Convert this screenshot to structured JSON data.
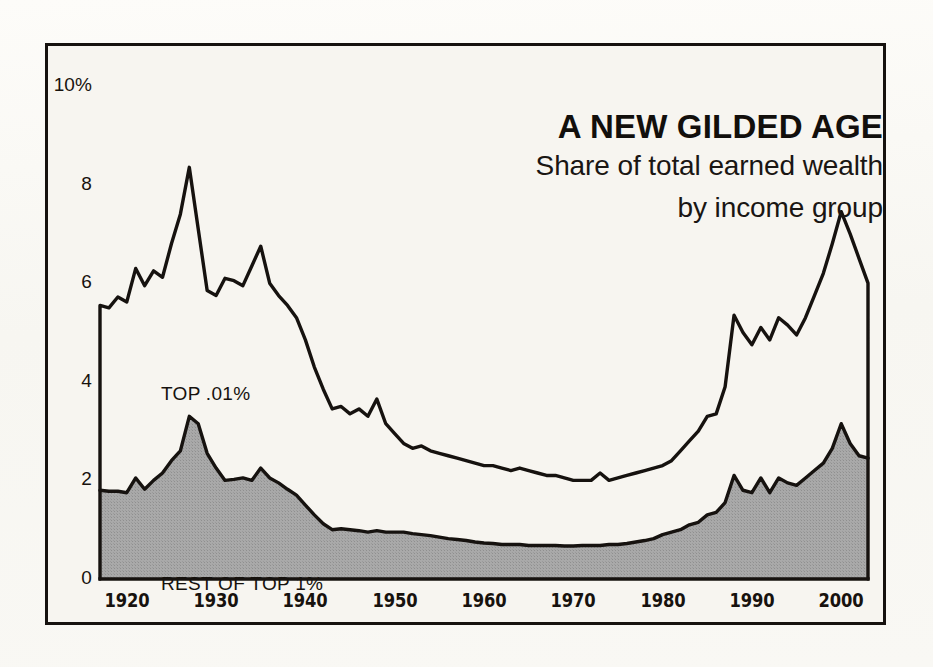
{
  "chart_data": {
    "type": "area",
    "title": "A NEW GILDED AGE",
    "subtitle_line1": "Share of total earned wealth",
    "subtitle_line2": "by income group",
    "xlabel": "",
    "ylabel": "",
    "ylim": [
      0,
      10
    ],
    "xlim": [
      1917,
      2003
    ],
    "grid": false,
    "legend_position": "inline-annotation",
    "y_ticks": [
      "10%",
      "8",
      "6",
      "4",
      "2",
      "0"
    ],
    "y_tick_values": [
      10,
      8,
      6,
      4,
      2,
      0
    ],
    "x_ticks": [
      "1920",
      "1930",
      "1940",
      "1950",
      "1960",
      "1970",
      "1980",
      "1990",
      "2000"
    ],
    "x_tick_values": [
      1920,
      1930,
      1940,
      1950,
      1960,
      1970,
      1980,
      1990,
      2000
    ],
    "annotations": [
      {
        "name": "top-01-label",
        "text": "TOP .01%",
        "x": 1920,
        "y": 4.85
      },
      {
        "name": "rest-of-top-1-label",
        "text": "REST OF TOP 1%",
        "x": 1920,
        "y": 1.0
      }
    ],
    "colors": {
      "line": "#16120f",
      "fill_lower": "#a5a5a5",
      "fill_upper": "#f7f5f0",
      "background": "#f7f5f0",
      "page": "#fbfaf7",
      "frame": "#16120f",
      "text": "#17120e"
    },
    "x": [
      1917,
      1918,
      1919,
      1920,
      1921,
      1922,
      1923,
      1924,
      1925,
      1926,
      1927,
      1928,
      1929,
      1930,
      1931,
      1932,
      1933,
      1934,
      1935,
      1936,
      1937,
      1938,
      1939,
      1940,
      1941,
      1942,
      1943,
      1944,
      1945,
      1946,
      1947,
      1948,
      1949,
      1950,
      1951,
      1952,
      1953,
      1954,
      1955,
      1956,
      1957,
      1958,
      1959,
      1960,
      1961,
      1962,
      1963,
      1964,
      1965,
      1966,
      1967,
      1968,
      1969,
      1970,
      1971,
      1972,
      1973,
      1974,
      1975,
      1976,
      1977,
      1978,
      1979,
      1980,
      1981,
      1982,
      1983,
      1984,
      1985,
      1986,
      1987,
      1988,
      1989,
      1990,
      1991,
      1992,
      1993,
      1994,
      1995,
      1996,
      1997,
      1998,
      1999,
      2000,
      2001,
      2002,
      2003
    ],
    "series": [
      {
        "name": "TOP .01%",
        "note": "Upper boundary: total share of top 1% (top .01% band is the white area between this line and the gray area)",
        "values": [
          5.55,
          5.5,
          5.72,
          5.62,
          6.3,
          5.95,
          6.25,
          6.12,
          6.8,
          7.4,
          8.35,
          7.1,
          5.85,
          5.75,
          6.1,
          6.05,
          5.95,
          6.35,
          6.75,
          6.0,
          5.75,
          5.55,
          5.3,
          4.85,
          4.3,
          3.85,
          3.45,
          3.5,
          3.35,
          3.45,
          3.3,
          3.65,
          3.15,
          2.95,
          2.75,
          2.65,
          2.7,
          2.6,
          2.55,
          2.5,
          2.45,
          2.4,
          2.35,
          2.3,
          2.3,
          2.25,
          2.2,
          2.25,
          2.2,
          2.15,
          2.1,
          2.1,
          2.05,
          2.0,
          2.0,
          2.0,
          2.15,
          2.0,
          2.05,
          2.1,
          2.15,
          2.2,
          2.25,
          2.3,
          2.4,
          2.6,
          2.8,
          3.0,
          3.3,
          3.35,
          3.9,
          5.35,
          5.0,
          4.75,
          5.1,
          4.85,
          5.3,
          5.15,
          4.95,
          5.3,
          5.75,
          6.2,
          6.8,
          7.45,
          7.0,
          6.5,
          6.0
        ]
      },
      {
        "name": "REST OF TOP 1%",
        "note": "Lower filled (gray) area",
        "values": [
          1.8,
          1.78,
          1.78,
          1.75,
          2.05,
          1.82,
          2.0,
          2.15,
          2.4,
          2.6,
          3.3,
          3.15,
          2.55,
          2.25,
          2.0,
          2.02,
          2.05,
          2.0,
          2.25,
          2.05,
          1.95,
          1.82,
          1.7,
          1.5,
          1.3,
          1.12,
          1.0,
          1.02,
          1.0,
          0.98,
          0.95,
          0.98,
          0.95,
          0.95,
          0.95,
          0.92,
          0.9,
          0.88,
          0.85,
          0.82,
          0.8,
          0.78,
          0.75,
          0.73,
          0.72,
          0.7,
          0.7,
          0.7,
          0.68,
          0.68,
          0.68,
          0.68,
          0.67,
          0.67,
          0.68,
          0.68,
          0.68,
          0.7,
          0.7,
          0.72,
          0.75,
          0.78,
          0.82,
          0.9,
          0.95,
          1.0,
          1.1,
          1.15,
          1.3,
          1.35,
          1.55,
          2.1,
          1.8,
          1.75,
          2.05,
          1.75,
          2.05,
          1.95,
          1.9,
          2.05,
          2.2,
          2.35,
          2.65,
          3.15,
          2.75,
          2.5,
          2.45
        ]
      }
    ]
  }
}
